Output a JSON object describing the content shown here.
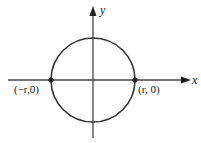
{
  "diagram": {
    "axes": {
      "x_label": "x",
      "y_label": "y"
    },
    "circle": {
      "center": [
        0,
        0
      ],
      "radius": "r"
    },
    "points": [
      {
        "label": "(−r,0)",
        "coords": [
          "-r",
          0
        ]
      },
      {
        "label": "(r, 0)",
        "coords": [
          "r",
          0
        ]
      }
    ],
    "colors": {
      "stroke": "#333333",
      "background": "#ffffff"
    }
  }
}
